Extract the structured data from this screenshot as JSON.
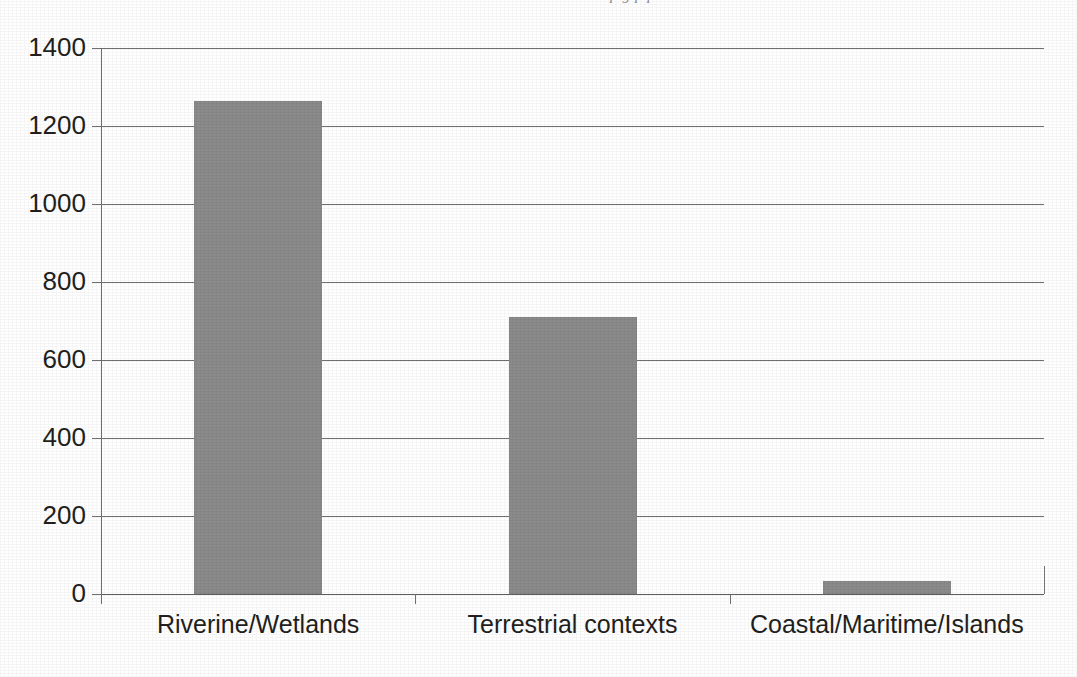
{
  "page": {
    "header_remnant": "p                        g  p  p"
  },
  "chart_data": {
    "type": "bar",
    "title": "",
    "subtitle": "",
    "xlabel": "",
    "ylabel": "",
    "categories": [
      "Riverine/Wetlands",
      "Terrestrial contexts",
      "Coastal/Maritime/Islands"
    ],
    "values": [
      1265,
      710,
      33
    ],
    "series": [
      {
        "name": "Count",
        "values": [
          1265,
          710,
          33
        ]
      }
    ],
    "ylim": [
      0,
      1400
    ],
    "ytick_values": [
      0,
      200,
      400,
      600,
      800,
      1000,
      1200,
      1400
    ],
    "ytick_labels": [
      "0",
      "200",
      "400",
      "600",
      "800",
      "1000",
      "1200",
      "1400"
    ],
    "grid": "horizontal",
    "legend": "none",
    "bar_color": "#8b8b8b",
    "axis_color": "#6f6f6f",
    "text_color": "#231f20"
  }
}
